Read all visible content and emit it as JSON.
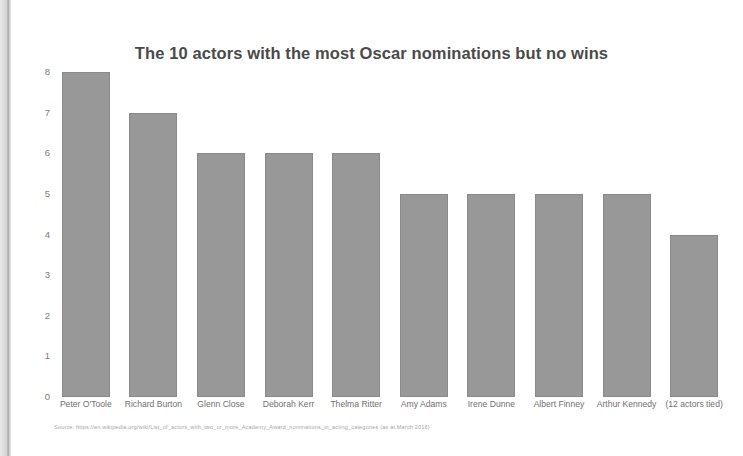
{
  "page": {
    "background_color": "#ffffff",
    "edge_artifact_color": "#cfcfcf"
  },
  "chart_data": {
    "type": "bar",
    "title": "The 10 actors with the most Oscar nominations but no wins",
    "xlabel": "",
    "ylabel": "",
    "ylim": [
      0,
      8
    ],
    "yticks": [
      "0",
      "1",
      "2",
      "3",
      "4",
      "5",
      "6",
      "7",
      "8"
    ],
    "grid": false,
    "legend": false,
    "bar_color": "#989898",
    "categories": [
      "Peter O'Toole",
      "Richard Burton",
      "Glenn Close",
      "Deborah Kerr",
      "Thelma Ritter",
      "Amy Adams",
      "Irene Dunne",
      "Albert Finney",
      "Arthur Kennedy",
      "(12 actors tied)"
    ],
    "values": [
      8,
      7,
      6,
      6,
      6,
      5,
      5,
      5,
      5,
      4
    ]
  },
  "source": {
    "text": "Source: https://en.wikipedia.org/wiki/List_of_actors_with_two_or_more_Academy_Award_nominations_in_acting_categories (as at March 2016)"
  }
}
